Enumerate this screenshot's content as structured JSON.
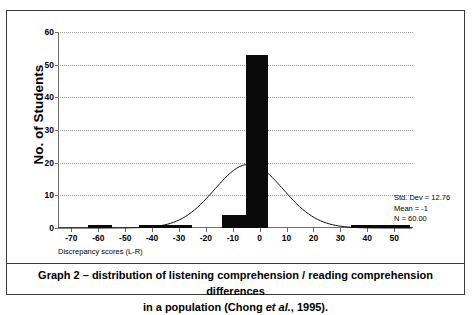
{
  "chart_data": {
    "type": "bar",
    "title": "",
    "xlabel": "Discrepancy scores (L-R)",
    "ylabel": "No. of Students",
    "xlim": [
      -75,
      57
    ],
    "ylim": [
      0,
      60
    ],
    "xticks": [
      -70,
      -60,
      -50,
      -40,
      -30,
      -20,
      -10,
      0,
      10,
      20,
      30,
      40,
      50
    ],
    "yticks": [
      0,
      10,
      20,
      30,
      40,
      50,
      60
    ],
    "grid": true,
    "legend_position": "right",
    "bars": [
      {
        "x_start": -64,
        "x_end": -55,
        "value": 1
      },
      {
        "x_start": -45,
        "x_end": -25,
        "value": 1
      },
      {
        "x_start": -14,
        "x_end": -5,
        "value": 4
      },
      {
        "x_start": -5,
        "x_end": 3,
        "value": 53
      },
      {
        "x_start": 34,
        "x_end": 56,
        "value": 1
      }
    ],
    "overlay_curve": {
      "type": "normal",
      "mean": -4,
      "std_dev": 12.76,
      "peak_value": 19.5
    },
    "annotations": [
      "Std. Dev = 12.76",
      "Mean = -1",
      "N = 60.00"
    ]
  },
  "stats": {
    "std_dev": "Std. Dev = 12.76",
    "mean": "Mean = -1",
    "n": "N = 60.00"
  },
  "axes": {
    "y_title": "No. of Students",
    "x_title": "Discrepancy scores (L-R)"
  },
  "caption": {
    "line1_a": "Graph 2 – distribution of listening comprehension / reading comprehension differences",
    "line2_a": "in a population (Chong ",
    "line2_italic": "et al.",
    "line2_b": ", 1995)."
  }
}
